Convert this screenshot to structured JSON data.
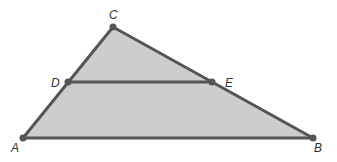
{
  "diagram": {
    "type": "triangle-with-midsegment",
    "colors": {
      "fill": "#cdcdcd",
      "stroke": "#555555",
      "point": "#555555",
      "label": "#333333"
    },
    "points": {
      "A": {
        "label": "A",
        "x": 23,
        "y": 138,
        "lx": 11,
        "ly": 152
      },
      "B": {
        "label": "B",
        "x": 313,
        "y": 138,
        "lx": 314,
        "ly": 152
      },
      "C": {
        "label": "C",
        "x": 113,
        "y": 27,
        "lx": 109,
        "ly": 19
      },
      "D": {
        "label": "D",
        "x": 68,
        "y": 82,
        "lx": 51,
        "ly": 87
      },
      "E": {
        "label": "E",
        "x": 212,
        "y": 82,
        "lx": 225,
        "ly": 87
      }
    },
    "triangle": [
      "A",
      "B",
      "C"
    ],
    "segments": [
      [
        "A",
        "B"
      ],
      [
        "B",
        "C"
      ],
      [
        "C",
        "A"
      ],
      [
        "D",
        "E"
      ]
    ]
  }
}
